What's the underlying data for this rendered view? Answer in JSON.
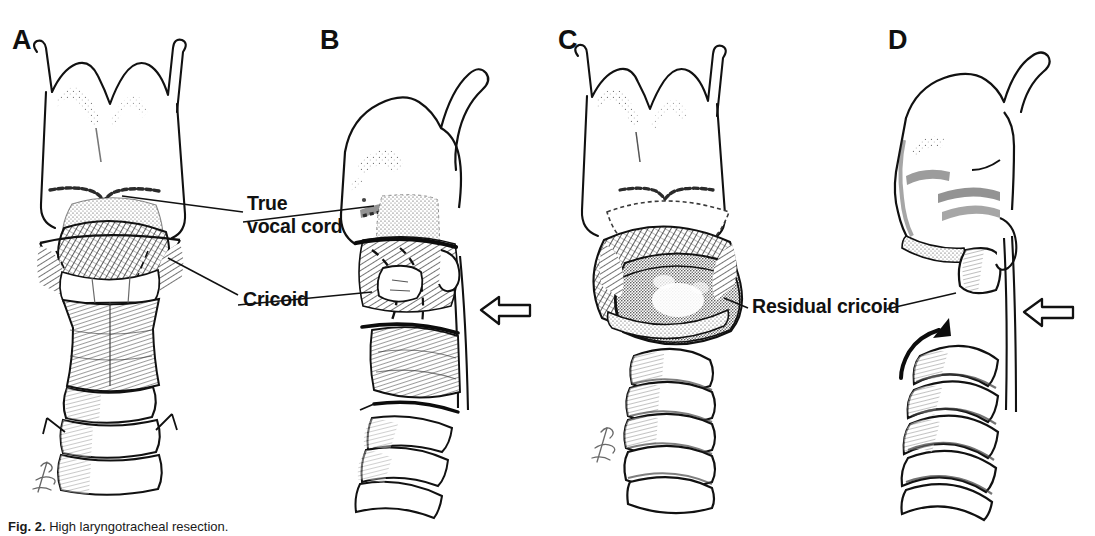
{
  "figure": {
    "type": "medical-illustration",
    "background_color": "#ffffff",
    "ink_color": "#111111",
    "panel_count": 4
  },
  "panels": [
    {
      "id": "A",
      "label": "A",
      "view": "anterior",
      "description": "Intact larynx and cervical trachea, anterior view with true vocal cord and cricoid cartilage identified"
    },
    {
      "id": "B",
      "label": "B",
      "view": "lateral",
      "description": "Lateral view showing planned resection lines through the cricoid and trachea"
    },
    {
      "id": "C",
      "label": "C",
      "view": "anterior",
      "description": "Anterior view after resection showing residual cricoid and the divided trachea below"
    },
    {
      "id": "D",
      "label": "D",
      "view": "lateral",
      "description": "Lateral view after resection with the trachea advanced toward the residual cricoid"
    }
  ],
  "annotations": [
    {
      "id": "true-vocal-cord",
      "line1": "True",
      "line2": "vocal cord",
      "text": "True vocal cord",
      "panels": [
        "A",
        "B"
      ]
    },
    {
      "id": "cricoid",
      "text": "Cricoid",
      "panels": [
        "A",
        "B"
      ]
    },
    {
      "id": "residual-cricoid",
      "text": "Residual cricoid",
      "panels": [
        "C",
        "D"
      ]
    }
  ],
  "markers": [
    {
      "id": "hollow-arrow-b",
      "kind": "hollow-block-arrow",
      "direction": "left",
      "panel": "B"
    },
    {
      "id": "hollow-arrow-d",
      "kind": "hollow-block-arrow",
      "direction": "left",
      "panel": "D"
    },
    {
      "id": "curved-arrow-d",
      "kind": "solid-curved-arrow",
      "direction": "up-right",
      "panel": "D"
    }
  ],
  "caption": {
    "label": "Fig. 2.",
    "text": "High laryngotracheal resection."
  }
}
